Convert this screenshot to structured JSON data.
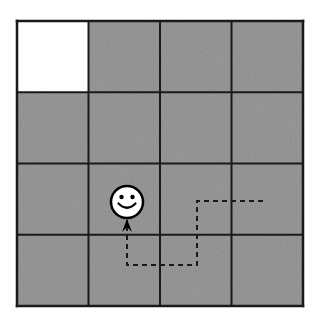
{
  "scene": {
    "title": "Gridworld maze with agent and dashed trajectory",
    "type": "grid-maze",
    "width": 314,
    "height": 321,
    "background_color": "#ffffff"
  },
  "grid": {
    "rows": 4,
    "cols": 4,
    "origin_x": 17,
    "origin_y": 21,
    "cell_width": 71.5,
    "cell_height": 71.25,
    "line_color": "#1a1a1a",
    "line_width": 2,
    "border_width": 2.5,
    "filled_color": "#9a9a9a",
    "empty_color": "#ffffff",
    "cells": [
      [
        {
          "row": 0,
          "col": 0,
          "state": "empty",
          "fill": "#ffffff",
          "label": "goal"
        },
        {
          "row": 0,
          "col": 1,
          "state": "filled",
          "fill": "#9a9a9a",
          "label": ""
        },
        {
          "row": 0,
          "col": 2,
          "state": "filled",
          "fill": "#9a9a9a",
          "label": ""
        },
        {
          "row": 0,
          "col": 3,
          "state": "filled",
          "fill": "#9a9a9a",
          "label": ""
        }
      ],
      [
        {
          "row": 1,
          "col": 0,
          "state": "filled",
          "fill": "#9a9a9a",
          "label": ""
        },
        {
          "row": 1,
          "col": 1,
          "state": "filled",
          "fill": "#9a9a9a",
          "label": ""
        },
        {
          "row": 1,
          "col": 2,
          "state": "filled",
          "fill": "#9a9a9a",
          "label": ""
        },
        {
          "row": 1,
          "col": 3,
          "state": "filled",
          "fill": "#9a9a9a",
          "label": ""
        }
      ],
      [
        {
          "row": 2,
          "col": 0,
          "state": "filled",
          "fill": "#9a9a9a",
          "label": ""
        },
        {
          "row": 2,
          "col": 1,
          "state": "filled",
          "fill": "#9a9a9a",
          "label": ""
        },
        {
          "row": 2,
          "col": 2,
          "state": "filled",
          "fill": "#9a9a9a",
          "label": ""
        },
        {
          "row": 2,
          "col": 3,
          "state": "filled",
          "fill": "#9a9a9a",
          "label": ""
        }
      ],
      [
        {
          "row": 3,
          "col": 0,
          "state": "filled",
          "fill": "#9a9a9a",
          "label": ""
        },
        {
          "row": 3,
          "col": 1,
          "state": "filled",
          "fill": "#9a9a9a",
          "label": ""
        },
        {
          "row": 3,
          "col": 2,
          "state": "filled",
          "fill": "#9a9a9a",
          "label": ""
        },
        {
          "row": 3,
          "col": 3,
          "state": "filled",
          "fill": "#9a9a9a",
          "label": ""
        }
      ]
    ]
  },
  "agent": {
    "icon": "smiley-face-icon",
    "center_x": 127,
    "center_y": 202,
    "radius": 16,
    "face_color": "#ffffff",
    "outline_color": "#000000",
    "outline_width": 2.5,
    "eye_radius": 2.2,
    "eye_offset_x": 5.5,
    "eye_offset_y": 5.0,
    "cell_row": 2,
    "cell_col": 1
  },
  "trajectory": {
    "style": "dashed",
    "color": "#1a1a1a",
    "line_width": 2,
    "dash_pattern": "5 4",
    "points": [
      {
        "x": 263,
        "y": 201
      },
      {
        "x": 197,
        "y": 201
      },
      {
        "x": 197,
        "y": 265
      },
      {
        "x": 127,
        "y": 265
      },
      {
        "x": 127,
        "y": 220
      }
    ],
    "arrow": {
      "icon": "arrow-head-up-icon",
      "tip_x": 127,
      "tip_y": 219,
      "half_width": 5,
      "height": 13,
      "color": "#000000"
    }
  }
}
